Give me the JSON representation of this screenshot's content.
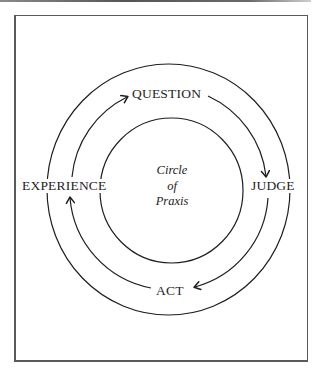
{
  "diagram": {
    "title_lines": [
      "Circle",
      "of",
      "Praxis"
    ],
    "stages": {
      "top": "QUESTION",
      "right": "JUDGE",
      "bottom": "ACT",
      "left": "EXPERIENCE"
    },
    "flow": [
      {
        "from": "EXPERIENCE",
        "to": "QUESTION"
      },
      {
        "from": "QUESTION",
        "to": "JUDGE"
      },
      {
        "from": "JUDGE",
        "to": "ACT"
      },
      {
        "from": "ACT",
        "to": "EXPERIENCE"
      }
    ],
    "colors": {
      "stroke": "#1e1e1e",
      "frame": "#5a5a5a",
      "background": "#ffffff"
    }
  }
}
